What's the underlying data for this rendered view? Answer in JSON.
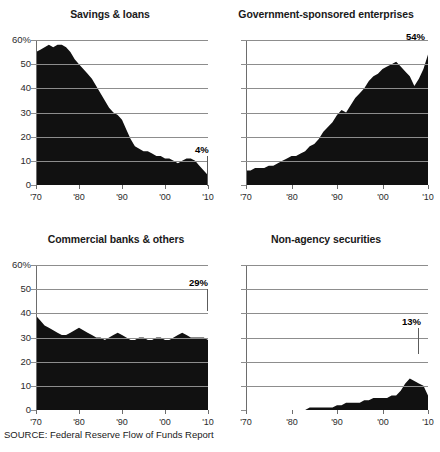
{
  "source_note": "SOURCE: Federal Reserve Flow of Funds Report",
  "axes": {
    "y_ticks": [
      "60%",
      "50",
      "40",
      "30",
      "20",
      "10",
      "0"
    ],
    "x_ticks": [
      "'70",
      "'80",
      "'90",
      "'00",
      "'10"
    ]
  },
  "chart_data": [
    {
      "type": "area",
      "title": "Savings & loans",
      "xlabel": "",
      "ylabel": "",
      "ylim": [
        0,
        60
      ],
      "xlim": [
        1970,
        2010
      ],
      "grid": true,
      "legend": "none",
      "ytick_labels": [
        "60%",
        "50",
        "40",
        "30",
        "20",
        "10",
        "0"
      ],
      "xtick_labels": [
        "'70",
        "'80",
        "'90",
        "'00",
        "'10"
      ],
      "annotation": "4%",
      "annotation_value": 4,
      "x": [
        1970,
        1971,
        1972,
        1973,
        1974,
        1975,
        1976,
        1977,
        1978,
        1979,
        1980,
        1981,
        1982,
        1983,
        1984,
        1985,
        1986,
        1987,
        1988,
        1989,
        1990,
        1991,
        1992,
        1993,
        1994,
        1995,
        1996,
        1997,
        1998,
        1999,
        2000,
        2001,
        2002,
        2003,
        2004,
        2005,
        2006,
        2007,
        2008,
        2009,
        2010
      ],
      "values": [
        55,
        56,
        57,
        58,
        57,
        58,
        58,
        57,
        55,
        52,
        50,
        48,
        46,
        44,
        41,
        38,
        35,
        32,
        30,
        29,
        27,
        23,
        19,
        16,
        15,
        14,
        14,
        13,
        12,
        12,
        11,
        11,
        10,
        9,
        10,
        11,
        11,
        10,
        8,
        6,
        4
      ]
    },
    {
      "type": "area",
      "title": "Government-sponsored enterprises",
      "xlabel": "",
      "ylabel": "",
      "ylim": [
        0,
        60
      ],
      "xlim": [
        1970,
        2010
      ],
      "grid": true,
      "legend": "none",
      "xtick_labels": [
        "'70",
        "'80",
        "'90",
        "'00",
        "'10"
      ],
      "annotation": "54%",
      "annotation_value": 54,
      "x": [
        1970,
        1971,
        1972,
        1973,
        1974,
        1975,
        1976,
        1977,
        1978,
        1979,
        1980,
        1981,
        1982,
        1983,
        1984,
        1985,
        1986,
        1987,
        1988,
        1989,
        1990,
        1991,
        1992,
        1993,
        1994,
        1995,
        1996,
        1997,
        1998,
        1999,
        2000,
        2001,
        2002,
        2003,
        2004,
        2005,
        2006,
        2007,
        2008,
        2009,
        2010
      ],
      "values": [
        6,
        6,
        7,
        7,
        7,
        8,
        8,
        9,
        10,
        11,
        12,
        12,
        13,
        14,
        16,
        17,
        19,
        22,
        24,
        26,
        29,
        31,
        30,
        33,
        36,
        38,
        40,
        43,
        45,
        46,
        48,
        49,
        50,
        51,
        49,
        47,
        45,
        41,
        44,
        48,
        54
      ]
    },
    {
      "type": "area",
      "title": "Commercial banks & others",
      "xlabel": "",
      "ylabel": "",
      "ylim": [
        0,
        60
      ],
      "xlim": [
        1970,
        2010
      ],
      "grid": true,
      "legend": "none",
      "ytick_labels": [
        "60%",
        "50",
        "40",
        "30",
        "20",
        "10",
        "0"
      ],
      "xtick_labels": [
        "'70",
        "'80",
        "'90",
        "'00",
        "'10"
      ],
      "annotation": "29%",
      "annotation_value": 29,
      "x": [
        1970,
        1971,
        1972,
        1973,
        1974,
        1975,
        1976,
        1977,
        1978,
        1979,
        1980,
        1981,
        1982,
        1983,
        1984,
        1985,
        1986,
        1987,
        1988,
        1989,
        1990,
        1991,
        1992,
        1993,
        1994,
        1995,
        1996,
        1997,
        1998,
        1999,
        2000,
        2001,
        2002,
        2003,
        2004,
        2005,
        2006,
        2007,
        2008,
        2009,
        2010
      ],
      "values": [
        39,
        37,
        35,
        34,
        33,
        32,
        31,
        31,
        32,
        33,
        34,
        33,
        32,
        31,
        30,
        30,
        29,
        30,
        31,
        32,
        31,
        30,
        29,
        29,
        30,
        30,
        29,
        29,
        30,
        30,
        29,
        29,
        30,
        31,
        32,
        31,
        30,
        30,
        30,
        30,
        29
      ]
    },
    {
      "type": "area",
      "title": "Non-agency securities",
      "xlabel": "",
      "ylabel": "",
      "ylim": [
        0,
        60
      ],
      "xlim": [
        1970,
        2010
      ],
      "grid": true,
      "legend": "none",
      "xtick_labels": [
        "'70",
        "'80",
        "'90",
        "'00",
        "'10"
      ],
      "annotation": "13%",
      "annotation_value": 13,
      "x": [
        1970,
        1971,
        1972,
        1973,
        1974,
        1975,
        1976,
        1977,
        1978,
        1979,
        1980,
        1981,
        1982,
        1983,
        1984,
        1985,
        1986,
        1987,
        1988,
        1989,
        1990,
        1991,
        1992,
        1993,
        1994,
        1995,
        1996,
        1997,
        1998,
        1999,
        2000,
        2001,
        2002,
        2003,
        2004,
        2005,
        2006,
        2007,
        2008,
        2009,
        2010
      ],
      "values": [
        0,
        0,
        0,
        0,
        0,
        0,
        0,
        0,
        0,
        0,
        0,
        0,
        0,
        0,
        1,
        1,
        1,
        1,
        1,
        1,
        2,
        2,
        3,
        3,
        3,
        3,
        4,
        4,
        5,
        5,
        5,
        5,
        6,
        6,
        8,
        11,
        13,
        12,
        11,
        10,
        6
      ]
    }
  ]
}
